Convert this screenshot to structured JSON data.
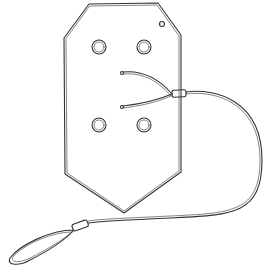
{
  "image": {
    "subject": "line drawing of a hexagonal plate with four holes and a wire lanyard with looped end",
    "colors": {
      "background": "#ffffff",
      "stroke": "#333333"
    }
  }
}
